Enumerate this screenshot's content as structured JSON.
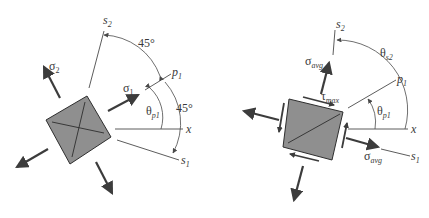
{
  "figure": {
    "left_panel": {
      "title": "Principal stress element",
      "labels": {
        "s2": "s",
        "s2_sub": "2",
        "s1": "s",
        "s1_sub": "1",
        "p1": "p",
        "p1_sub": "1",
        "x": "x",
        "sigma1": "σ",
        "sigma1_sub": "1",
        "sigma2": "σ",
        "sigma2_sub": "2",
        "theta_p1": "θ",
        "theta_p1_sub": "p1",
        "angle_top": "45°",
        "angle_right": "45°"
      }
    },
    "right_panel": {
      "title": "Maximum in-plane shear stress element",
      "labels": {
        "s2": "s",
        "s2_sub": "2",
        "s1": "s",
        "s1_sub": "1",
        "p1": "p",
        "p1_sub": "1",
        "x": "x",
        "sigma_avg_top": "σ",
        "sigma_avg_top_sub": "avg",
        "sigma_avg_right": "σ",
        "sigma_avg_right_sub": "avg",
        "tau_max": "τ",
        "tau_max_sub": "max",
        "theta_s2": "θ",
        "theta_s2_sub": "s2",
        "theta_p1": "θ",
        "theta_p1_sub": "p1"
      }
    },
    "colors": {
      "element_fill": "#8f8f8f",
      "line": "#3c3c3c",
      "background": "#ffffff"
    }
  }
}
